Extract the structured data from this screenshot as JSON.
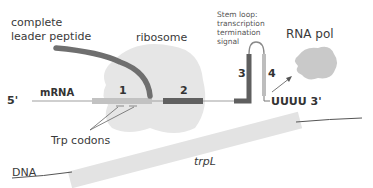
{
  "labels": {
    "leader_peptide_line1": "complete",
    "leader_peptide_line2": "leader peptide",
    "ribosome": "ribosome",
    "stem_loop_line1": "Stem loop:",
    "stem_loop_line2": "transcription",
    "stem_loop_line3": "termination",
    "stem_loop_line4": "signal",
    "rna_pol": "RNA pol",
    "five_prime": "5'",
    "mrna": "mRNA",
    "region1": "1",
    "region2": "2",
    "region3": "3",
    "region4": "4",
    "three_prime_end": "UUUU 3'",
    "trp_codons": "Trp codons",
    "dna": "DNA",
    "trpL": "trpL"
  },
  "colors": {
    "ribosome": "#e4e4e4",
    "rna_pol": "#c8c8c8",
    "peptide": "#6e6e6e",
    "region_dark": "#5f5f5f",
    "region_light": "#bdbdbd",
    "mrna_line": "#9a9a9a",
    "dna_band": "#e2e2e2",
    "text": "#3a3a3a"
  }
}
